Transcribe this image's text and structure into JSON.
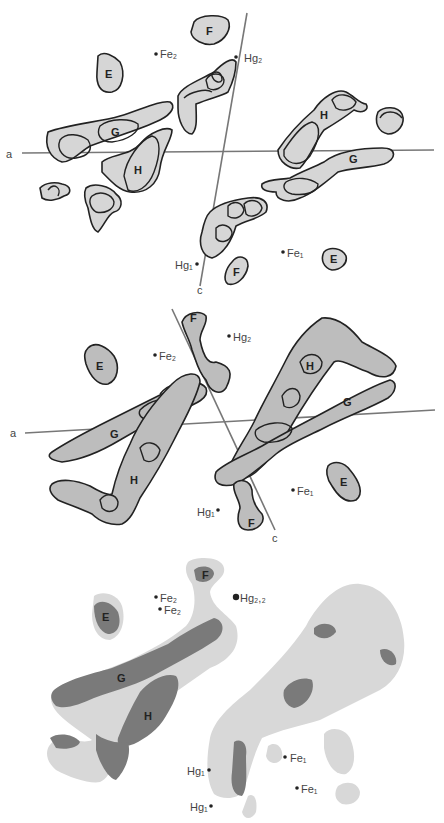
{
  "panels": [
    {
      "name": "panel-1",
      "axes": {
        "a": "a",
        "c": "c"
      },
      "helix_labels": {
        "F1": "F",
        "E1": "E",
        "G1": "G",
        "H1": "H",
        "H2": "H",
        "G2": "G",
        "F2": "F",
        "E2": "E"
      },
      "atoms": {
        "fe2": "Fe₂",
        "hg2": "Hg₂",
        "fe1": "Fe₁",
        "hg1": "Hg₁"
      }
    },
    {
      "name": "panel-2",
      "axes": {
        "a": "a",
        "c": "c"
      },
      "helix_labels": {
        "F1": "F",
        "E1": "E",
        "G1": "G",
        "H1": "H",
        "H2": "H",
        "G2": "G",
        "F2": "F",
        "E2": "E"
      },
      "atoms": {
        "fe2": "Fe₂",
        "hg2": "Hg₂",
        "fe1": "Fe₁",
        "hg1": "Hg₁"
      }
    },
    {
      "name": "panel-3",
      "helix_labels": {
        "F": "F",
        "E": "E",
        "G": "G",
        "H": "H"
      },
      "atoms": {
        "fe2a": "Fe₂",
        "fe2b": "Fe₂",
        "hg22": "Hg₂,₂",
        "fe1a": "Fe₁",
        "fe1b": "Fe₁",
        "hg1a": "Hg₁",
        "hg1b": "Hg₁"
      }
    }
  ]
}
